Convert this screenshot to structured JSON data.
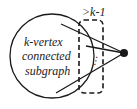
{
  "diagram": {
    "subgraph_label_lines": [
      "k-vertex",
      "connected",
      "subgraph"
    ],
    "boundary_label": ">k-1",
    "ellipsis": "⋮",
    "colors": {
      "stroke": "#1a1a1a",
      "text": "#222222",
      "background": "#ffffff"
    }
  }
}
